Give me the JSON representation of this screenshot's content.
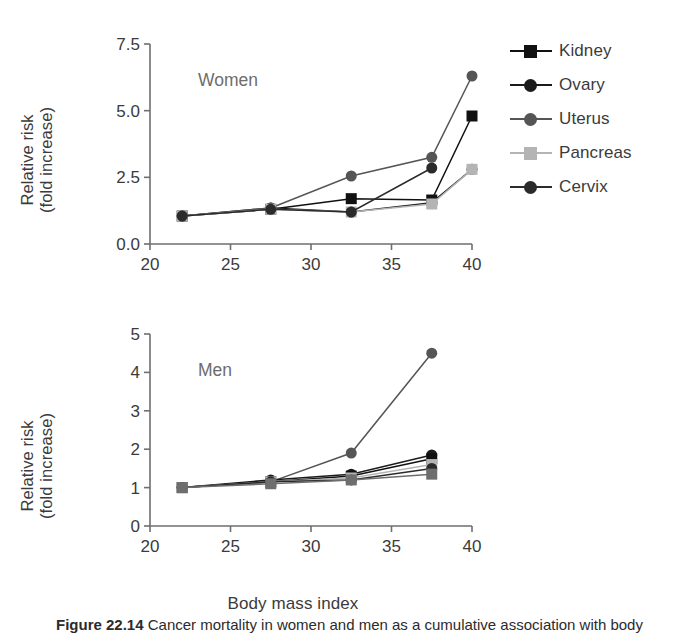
{
  "figure": {
    "xaxis_title": "Body mass index",
    "caption_prefix": "Figure 22.14",
    "caption_text": "Cancer mortality in women and men as a cumulative association with body"
  },
  "chart_data": [
    {
      "type": "line",
      "title": "Women",
      "xlabel": "Body mass index",
      "ylabel": "Relative risk\n(fold increase)",
      "xlim": [
        20,
        40
      ],
      "ylim": [
        0,
        7.5
      ],
      "xticks": [
        20,
        25,
        30,
        35,
        40
      ],
      "yticks": [
        "0.0",
        "2.5",
        "5.0",
        "7.5"
      ],
      "ytick_values": [
        0,
        2.5,
        5.0,
        7.5
      ],
      "grid": false,
      "legend_position": "right",
      "series": [
        {
          "name": "Kidney",
          "marker": "square",
          "color": "#111111",
          "x": [
            22,
            27.5,
            32.5,
            37.5,
            40
          ],
          "y": [
            1.05,
            1.3,
            1.7,
            1.65,
            4.8
          ]
        },
        {
          "name": "Ovary",
          "marker": "circle",
          "color": "#1b1b1b",
          "x": [
            22,
            27.5,
            32.5,
            37.5,
            40
          ],
          "y": [
            1.05,
            1.35,
            1.2,
            1.55,
            2.8
          ]
        },
        {
          "name": "Uterus",
          "marker": "circle",
          "color": "#555555",
          "x": [
            22,
            27.5,
            32.5,
            37.5,
            40
          ],
          "y": [
            1.05,
            1.35,
            2.55,
            3.25,
            6.3
          ]
        },
        {
          "name": "Pancreas",
          "marker": "square",
          "color": "#b4b4b4",
          "x": [
            22,
            27.5,
            32.5,
            37.5,
            40
          ],
          "y": [
            1.05,
            1.3,
            1.2,
            1.5,
            2.8
          ]
        },
        {
          "name": "Cervix",
          "marker": "circle",
          "color": "#2b2b2b",
          "x": [
            22,
            27.5,
            32.5,
            37.5
          ],
          "y": [
            1.05,
            1.3,
            1.2,
            2.85
          ]
        }
      ]
    },
    {
      "type": "line",
      "title": "Men",
      "xlabel": "Body mass index",
      "ylabel": "Relative risk\n(fold increase)",
      "xlim": [
        20,
        40
      ],
      "ylim": [
        0,
        5
      ],
      "xticks": [
        20,
        25,
        30,
        35,
        40
      ],
      "yticks": [
        "0",
        "1",
        "2",
        "3",
        "4",
        "5"
      ],
      "ytick_values": [
        0,
        1,
        2,
        3,
        4,
        5
      ],
      "grid": false,
      "legend_position": "right",
      "series": [
        {
          "name": "Liver",
          "marker": "circle",
          "color": "#555555",
          "x": [
            22,
            27.5,
            32.5,
            37.5
          ],
          "y": [
            1.0,
            1.15,
            1.9,
            4.5
          ]
        },
        {
          "name": "Colon",
          "marker": "circle",
          "color": "#1b1b1b",
          "x": [
            22,
            27.5,
            32.5,
            37.5
          ],
          "y": [
            1.0,
            1.2,
            1.35,
            1.85
          ]
        },
        {
          "name": "Esophagus",
          "marker": "square",
          "color": "#111111",
          "x": [
            22,
            27.5,
            32.5,
            37.5
          ],
          "y": [
            1.0,
            1.15,
            1.3,
            1.75
          ]
        },
        {
          "name": "Pancreas",
          "marker": "square",
          "color": "#b4b4b4",
          "x": [
            22,
            27.5,
            32.5,
            37.5
          ],
          "y": [
            1.0,
            1.15,
            1.25,
            1.6
          ]
        },
        {
          "name": "Prostate",
          "marker": "circle",
          "color": "#2b2b2b",
          "x": [
            22,
            27.5,
            32.5,
            37.5
          ],
          "y": [
            1.0,
            1.15,
            1.2,
            1.5
          ]
        },
        {
          "name": "Pancreas",
          "marker": "square",
          "color": "#6e6e6e",
          "x": [
            22,
            27.5,
            32.5,
            37.5
          ],
          "y": [
            1.0,
            1.1,
            1.2,
            1.35
          ]
        }
      ]
    }
  ]
}
